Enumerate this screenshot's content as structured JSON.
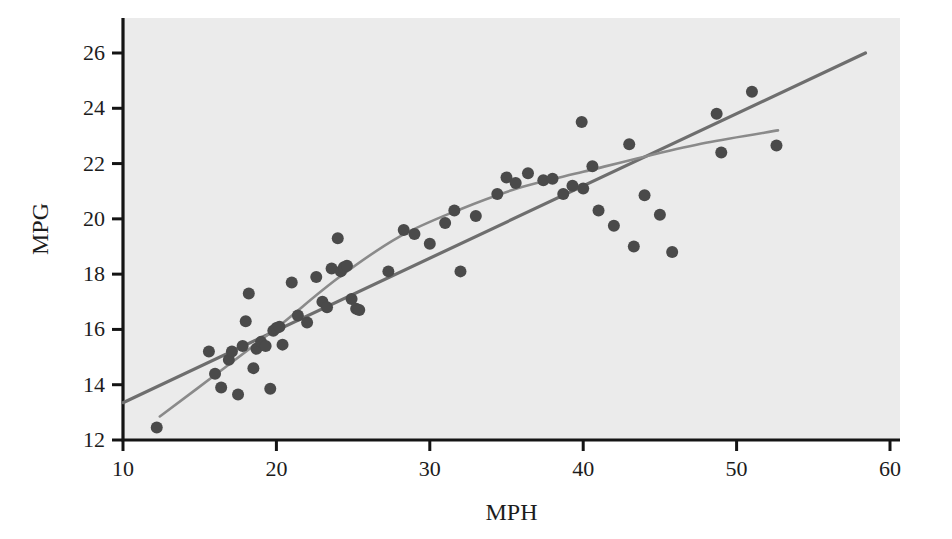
{
  "figure": {
    "background_color": "#ffffff",
    "plot_area_color": "#ebebeb",
    "width": 952,
    "height": 539
  },
  "chart_data": {
    "type": "scatter",
    "title": "",
    "xlabel": "MPH",
    "ylabel": "MPG",
    "xlim": [
      10,
      60
    ],
    "ylim": [
      12,
      27
    ],
    "xticks": [
      10,
      20,
      30,
      40,
      50,
      60
    ],
    "yticks": [
      12,
      14,
      16,
      18,
      20,
      22,
      24,
      26
    ],
    "xtick_labels": [
      "10",
      "20",
      "30",
      "40",
      "50",
      "60"
    ],
    "ytick_labels": [
      "12",
      "14",
      "16",
      "18",
      "20",
      "22",
      "24",
      "26"
    ],
    "grid": false,
    "legend": null,
    "marker_color": "#4a4a4a",
    "marker_size": 6,
    "points": [
      {
        "x": 12.2,
        "y": 12.45
      },
      {
        "x": 15.6,
        "y": 15.2
      },
      {
        "x": 16.0,
        "y": 14.4
      },
      {
        "x": 16.4,
        "y": 13.9
      },
      {
        "x": 16.9,
        "y": 14.9
      },
      {
        "x": 17.1,
        "y": 15.2
      },
      {
        "x": 17.5,
        "y": 13.65
      },
      {
        "x": 17.8,
        "y": 15.4
      },
      {
        "x": 18.0,
        "y": 16.3
      },
      {
        "x": 18.2,
        "y": 17.3
      },
      {
        "x": 18.5,
        "y": 14.6
      },
      {
        "x": 18.7,
        "y": 15.3
      },
      {
        "x": 19.0,
        "y": 15.55
      },
      {
        "x": 19.3,
        "y": 15.4
      },
      {
        "x": 19.6,
        "y": 13.85
      },
      {
        "x": 19.8,
        "y": 15.95
      },
      {
        "x": 20.0,
        "y": 16.05
      },
      {
        "x": 20.2,
        "y": 16.1
      },
      {
        "x": 20.4,
        "y": 15.45
      },
      {
        "x": 21.0,
        "y": 17.7
      },
      {
        "x": 21.4,
        "y": 16.5
      },
      {
        "x": 22.0,
        "y": 16.25
      },
      {
        "x": 22.6,
        "y": 17.9
      },
      {
        "x": 23.0,
        "y": 17.0
      },
      {
        "x": 23.3,
        "y": 16.8
      },
      {
        "x": 23.6,
        "y": 18.2
      },
      {
        "x": 24.0,
        "y": 19.3
      },
      {
        "x": 24.2,
        "y": 18.1
      },
      {
        "x": 24.4,
        "y": 18.25
      },
      {
        "x": 24.6,
        "y": 18.3
      },
      {
        "x": 24.9,
        "y": 17.1
      },
      {
        "x": 25.2,
        "y": 16.75
      },
      {
        "x": 25.4,
        "y": 16.7
      },
      {
        "x": 27.3,
        "y": 18.1
      },
      {
        "x": 28.3,
        "y": 19.6
      },
      {
        "x": 29.0,
        "y": 19.45
      },
      {
        "x": 30.0,
        "y": 19.1
      },
      {
        "x": 31.0,
        "y": 19.85
      },
      {
        "x": 31.6,
        "y": 20.3
      },
      {
        "x": 32.0,
        "y": 18.1
      },
      {
        "x": 33.0,
        "y": 20.1
      },
      {
        "x": 34.4,
        "y": 20.9
      },
      {
        "x": 35.0,
        "y": 21.5
      },
      {
        "x": 35.6,
        "y": 21.3
      },
      {
        "x": 36.4,
        "y": 21.65
      },
      {
        "x": 37.4,
        "y": 21.4
      },
      {
        "x": 38.0,
        "y": 21.45
      },
      {
        "x": 38.7,
        "y": 20.9
      },
      {
        "x": 39.3,
        "y": 21.2
      },
      {
        "x": 39.9,
        "y": 23.5
      },
      {
        "x": 40.0,
        "y": 21.1
      },
      {
        "x": 40.6,
        "y": 21.9
      },
      {
        "x": 41.0,
        "y": 20.3
      },
      {
        "x": 42.0,
        "y": 19.75
      },
      {
        "x": 43.0,
        "y": 22.7
      },
      {
        "x": 43.3,
        "y": 19.0
      },
      {
        "x": 44.0,
        "y": 20.85
      },
      {
        "x": 45.0,
        "y": 20.15
      },
      {
        "x": 45.8,
        "y": 18.8
      },
      {
        "x": 48.7,
        "y": 23.8
      },
      {
        "x": 49.0,
        "y": 22.4
      },
      {
        "x": 51.0,
        "y": 24.6
      },
      {
        "x": 52.6,
        "y": 22.65
      }
    ],
    "series": [
      {
        "name": "linear-fit",
        "type": "line",
        "color": "#6e6e6e",
        "linewidth": 3.2,
        "points": [
          {
            "x": 10.0,
            "y": 13.35
          },
          {
            "x": 58.4,
            "y": 26.0
          }
        ]
      },
      {
        "name": "loess-fit",
        "type": "curve",
        "color": "#8a8a8a",
        "linewidth": 2.6,
        "points": [
          {
            "x": 12.4,
            "y": 12.85
          },
          {
            "x": 16.0,
            "y": 14.35
          },
          {
            "x": 20.0,
            "y": 16.05
          },
          {
            "x": 24.0,
            "y": 17.85
          },
          {
            "x": 28.0,
            "y": 19.35
          },
          {
            "x": 32.0,
            "y": 20.35
          },
          {
            "x": 36.0,
            "y": 21.15
          },
          {
            "x": 40.0,
            "y": 21.7
          },
          {
            "x": 44.0,
            "y": 22.25
          },
          {
            "x": 48.0,
            "y": 22.75
          },
          {
            "x": 52.7,
            "y": 23.2
          }
        ]
      }
    ]
  }
}
